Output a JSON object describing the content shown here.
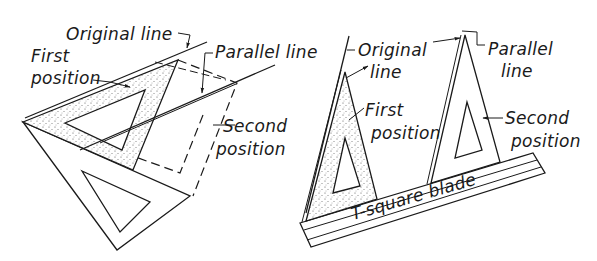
{
  "figure": {
    "left_panel": {
      "labels": {
        "original_line": "Original line",
        "first_position_1": "First",
        "first_position_2": "position",
        "parallel_line": "Parallel line",
        "second_position_1": "Second",
        "second_position_2": "position"
      }
    },
    "right_panel": {
      "labels": {
        "original_line_1": "Original",
        "original_line_2": "line",
        "first_position_1": "First",
        "first_position_2": "position",
        "parallel_line_1": "Parallel",
        "parallel_line_2": "line",
        "second_position_1": "Second",
        "second_position_2": "position",
        "tsquare_blade": "T-square blade"
      }
    },
    "colors": {
      "ink": "#1a1a1a",
      "paper": "#ffffff"
    }
  }
}
